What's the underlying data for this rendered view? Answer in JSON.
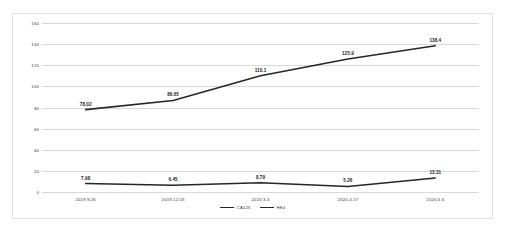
{
  "chart_data": {
    "type": "line",
    "title": "",
    "xlabel": "",
    "ylabel": "",
    "categories": [
      "2019.9.26",
      "2019.12.03",
      "2020.3.4",
      "2020.4.17",
      "2020.6.6"
    ],
    "series": [
      {
        "name": "CA125",
        "values": [
          78.02,
          86.65,
          110.1,
          125.9,
          138.4
        ],
        "labels": [
          "78.02",
          "86.65",
          "110.1",
          "125.9",
          "138.4"
        ],
        "color": "#262626"
      },
      {
        "name": "HE4",
        "values": [
          7.98,
          6.45,
          8.79,
          5.26,
          13.31
        ],
        "labels": [
          "7.98",
          "6.45",
          "8.79",
          "5.26",
          "13.31"
        ],
        "color": "#262626"
      }
    ],
    "ylim": [
      0,
      160
    ],
    "yticks": [
      160,
      140,
      120,
      100,
      80,
      60,
      40,
      20,
      0
    ],
    "ytick_labels": [
      "160",
      "140",
      "120",
      "100",
      "80",
      "60",
      "40",
      "20",
      "0"
    ],
    "grid": "horizontal",
    "legend_position": "bottom"
  },
  "legend": {
    "items": [
      {
        "label": "CA125"
      },
      {
        "label": "HE4"
      }
    ]
  }
}
